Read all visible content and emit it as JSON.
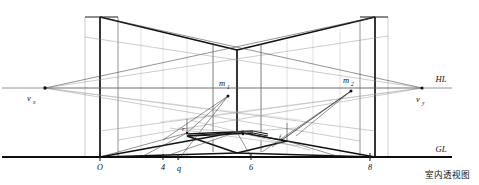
{
  "figure": {
    "caption": "室内透视图",
    "background_color": "#ffffff",
    "ink_color": "#111111"
  },
  "reference_lines": {
    "horizon": {
      "label": "HL",
      "y": 88,
      "x_start": 2,
      "x_end": 452
    },
    "ground": {
      "label": "GL",
      "y": 157,
      "x_start": 2,
      "x_end": 452
    }
  },
  "vanishing_points": [
    {
      "id": "vx",
      "label": "v",
      "subscript": "x",
      "x": 45,
      "y": 88,
      "label_x": 27,
      "label_y": 101
    },
    {
      "id": "vy",
      "label": "v",
      "subscript": "y",
      "x": 422,
      "y": 88,
      "label_x": 416,
      "label_y": 102
    }
  ],
  "measuring_points": [
    {
      "id": "m1",
      "label": "m",
      "subscript": "1",
      "x": 228,
      "y": 96,
      "label_x": 219,
      "label_y": 86
    },
    {
      "id": "m2",
      "label": "m",
      "subscript": "2",
      "x": 351,
      "y": 91,
      "label_x": 343,
      "label_y": 83
    }
  ],
  "ground_marks": [
    {
      "label": "O",
      "x": 100,
      "tick_y": 157,
      "label_x": 97,
      "label_y": 169
    },
    {
      "label": "4",
      "x": 163,
      "tick_y": 157,
      "label_x": 160,
      "label_y": 169
    },
    {
      "label": "q",
      "x": 178,
      "tick_y": 157,
      "label_x": 175,
      "label_y": 170
    },
    {
      "label": "6",
      "x": 251,
      "tick_y": 157,
      "label_x": 248,
      "label_y": 169
    },
    {
      "label": "8",
      "x": 370,
      "tick_y": 157,
      "label_x": 367,
      "label_y": 169
    }
  ],
  "interior_points": [
    {
      "label": "r",
      "x": 187,
      "y": 133,
      "label_x": 182,
      "label_y": 131
    },
    {
      "label": "e",
      "x": 243,
      "y": 134,
      "label_x": 241,
      "label_y": 133
    },
    {
      "label": "f",
      "x": 282,
      "y": 140,
      "label_x": 279,
      "label_y": 139
    }
  ],
  "room_geometry": {
    "center_corner_x": 237,
    "ceiling_peak_y": 50,
    "left_wall_front_x": 100,
    "right_wall_front_x": 375,
    "floor_center_y": 153,
    "ceiling_front_y": 17,
    "wall_top_left_y": 17,
    "wall_top_right_y": 17
  },
  "grid": {
    "vertical_guide_x": [
      85,
      100,
      118,
      141,
      163,
      187,
      213,
      237,
      261,
      287,
      313,
      340,
      360,
      375,
      388
    ],
    "note": "construction guides"
  }
}
